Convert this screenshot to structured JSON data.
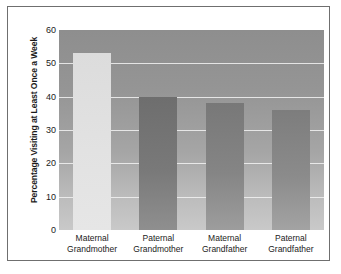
{
  "chart_data": {
    "type": "bar",
    "title": "",
    "xlabel": "",
    "ylabel": "Percentage Visiting at Least Once a Week",
    "categories": [
      "Maternal Grandmother",
      "Paternal Grandmother",
      "Maternal Grandfather",
      "Paternal Grandfather"
    ],
    "category_lines": [
      [
        "Maternal",
        "Grandmother"
      ],
      [
        "Paternal",
        "Grandmother"
      ],
      [
        "Maternal",
        "Grandfather"
      ],
      [
        "Paternal",
        "Grandfather"
      ]
    ],
    "values": [
      53,
      40,
      38,
      36
    ],
    "ylim": [
      0,
      60
    ],
    "yticks": [
      0,
      10,
      20,
      30,
      40,
      50,
      60
    ],
    "ytick_labels": [
      "0",
      "10",
      "20",
      "30",
      "40",
      "50",
      "60"
    ],
    "grid": "horizontal",
    "legend": "none",
    "bar_colors": [
      "#e2e2e2",
      "#797979",
      "#858585",
      "#8b8b8b"
    ],
    "gridline_color": "#f2f2f2",
    "plot_background": "#9a9a9a",
    "frame_color": "#6f6f6f",
    "text_color": "#1b1b1b"
  }
}
